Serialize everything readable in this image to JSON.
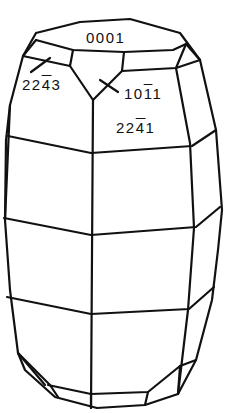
{
  "diagram": {
    "stroke_color": "#111111",
    "background": "#ffffff",
    "faces": [
      {
        "id": "basal",
        "index": "0001",
        "digits": [
          "0",
          "0",
          "0",
          "1"
        ],
        "bars": [
          false,
          false,
          false,
          false
        ]
      },
      {
        "id": "pyramid-upper-left",
        "index": "22-43",
        "digits": [
          "2",
          "2",
          "4",
          "3"
        ],
        "bars": [
          false,
          false,
          true,
          false
        ]
      },
      {
        "id": "pyramid-upper",
        "index": "10-11",
        "digits": [
          "1",
          "0",
          "1",
          "1"
        ],
        "bars": [
          false,
          false,
          true,
          false
        ]
      },
      {
        "id": "pyramid-steep",
        "index": "22-41",
        "digits": [
          "2",
          "2",
          "4",
          "1"
        ],
        "bars": [
          false,
          false,
          true,
          false
        ]
      }
    ]
  }
}
